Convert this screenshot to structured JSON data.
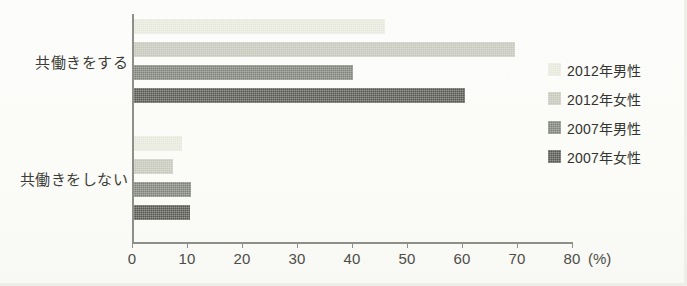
{
  "chart_data": {
    "type": "bar",
    "orientation": "horizontal",
    "title": "",
    "xlabel": "(%)",
    "ylabel": "",
    "xlim": [
      0,
      80
    ],
    "xticks": [
      0,
      10,
      20,
      30,
      40,
      50,
      60,
      70,
      80
    ],
    "xtick_labels": [
      "0",
      "10",
      "20",
      "30",
      "40",
      "50",
      "60",
      "70",
      "80"
    ],
    "unit": "(%)",
    "grid": false,
    "legend_position": "right",
    "categories": [
      "共働きをする",
      "共働きをしない"
    ],
    "series": [
      {
        "name": "2012年男性",
        "color": "#e7e8dc",
        "values": [
          45.6,
          8.7
        ]
      },
      {
        "name": "2012年女性",
        "color": "#c5c7bb",
        "values": [
          69.3,
          7.1
        ]
      },
      {
        "name": "2007年男性",
        "color": "#7e8079",
        "values": [
          39.8,
          10.4
        ]
      },
      {
        "name": "2007年女性",
        "color": "#565750",
        "values": [
          60.2,
          10.2
        ]
      }
    ]
  },
  "axis": {
    "line_color": "#8e8f88",
    "tick_text_color": "#4c4d47"
  },
  "background": {
    "color": "#fcfcfa"
  }
}
